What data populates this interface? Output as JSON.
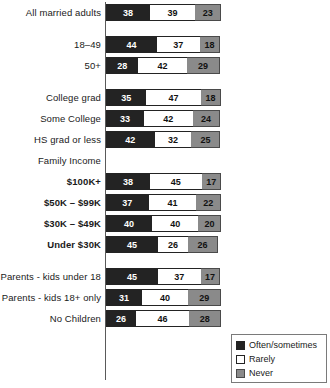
{
  "chart_data": {
    "type": "bar",
    "orientation": "horizontal",
    "stacked": true,
    "stack_total": 100,
    "title": "",
    "subtitle": "",
    "xlabel": "",
    "ylabel": "",
    "xlim": [
      0,
      100
    ],
    "grid": false,
    "legend_position": "bottom-right",
    "legend": [
      "Often/sometimes",
      "Rarely",
      "Never"
    ],
    "series": [
      {
        "name": "Often/sometimes",
        "color": "#232323",
        "values": [
          38,
          null,
          44,
          28,
          null,
          35,
          33,
          42,
          null,
          38,
          37,
          40,
          45,
          null,
          45,
          31,
          26
        ]
      },
      {
        "name": "Rarely",
        "color": "#ffffff",
        "values": [
          39,
          null,
          37,
          42,
          null,
          47,
          42,
          32,
          null,
          45,
          41,
          40,
          26,
          null,
          37,
          40,
          46
        ]
      },
      {
        "name": "Never",
        "color": "#8a8a8a",
        "values": [
          23,
          null,
          18,
          29,
          null,
          18,
          24,
          25,
          null,
          17,
          22,
          20,
          26,
          null,
          17,
          29,
          28
        ]
      }
    ],
    "categories": [
      "All married adults",
      "",
      "18–49",
      "50+",
      "",
      "College grad",
      "Some College",
      "HS grad or less",
      "Family Income",
      "$100K+",
      "$50K – $99K",
      "$30K – $49K",
      "Under $30K",
      "",
      "Parents - kids under 18",
      "Parents - kids 18+ only",
      "No Children"
    ],
    "rows": [
      {
        "label": "All married adults",
        "kind": "bar",
        "bold": false,
        "values": [
          38,
          39,
          23
        ]
      },
      {
        "label": "",
        "kind": "spacer",
        "bold": false,
        "values": []
      },
      {
        "label": "18–49",
        "kind": "bar",
        "bold": false,
        "values": [
          44,
          37,
          18
        ]
      },
      {
        "label": "50+",
        "kind": "bar",
        "bold": false,
        "values": [
          28,
          42,
          29
        ]
      },
      {
        "label": "",
        "kind": "spacer",
        "bold": false,
        "values": []
      },
      {
        "label": "College grad",
        "kind": "bar",
        "bold": false,
        "values": [
          35,
          47,
          18
        ]
      },
      {
        "label": "Some College",
        "kind": "bar",
        "bold": false,
        "values": [
          33,
          42,
          24
        ]
      },
      {
        "label": "HS grad or less",
        "kind": "bar",
        "bold": false,
        "values": [
          42,
          32,
          25
        ]
      },
      {
        "label": "Family Income",
        "kind": "header",
        "bold": false,
        "values": []
      },
      {
        "label": "$100K+",
        "kind": "bar",
        "bold": true,
        "values": [
          38,
          45,
          17
        ]
      },
      {
        "label": "$50K – $99K",
        "kind": "bar",
        "bold": true,
        "values": [
          37,
          41,
          22
        ]
      },
      {
        "label": "$30K – $49K",
        "kind": "bar",
        "bold": true,
        "values": [
          40,
          40,
          20
        ]
      },
      {
        "label": "Under $30K",
        "kind": "bar",
        "bold": true,
        "values": [
          45,
          26,
          26
        ]
      },
      {
        "label": "",
        "kind": "spacer",
        "bold": false,
        "values": []
      },
      {
        "label": "Parents - kids under 18",
        "kind": "bar",
        "bold": false,
        "values": [
          45,
          37,
          17
        ]
      },
      {
        "label": "Parents - kids 18+ only",
        "kind": "bar",
        "bold": false,
        "values": [
          31,
          40,
          29
        ]
      },
      {
        "label": "No Children",
        "kind": "bar",
        "bold": false,
        "values": [
          26,
          46,
          28
        ]
      }
    ],
    "colors": {
      "often_sometimes": "#232323",
      "rarely": "#ffffff",
      "never": "#8a8a8a",
      "axis": "#5a5a5a",
      "text": "#1a1a1a",
      "background": "#ffffff"
    }
  },
  "legend": {
    "items": [
      {
        "label": "Often/sometimes",
        "swatch": "#232323"
      },
      {
        "label": "Rarely",
        "swatch": "#ffffff"
      },
      {
        "label": "Never",
        "swatch": "#8a8a8a"
      }
    ]
  }
}
